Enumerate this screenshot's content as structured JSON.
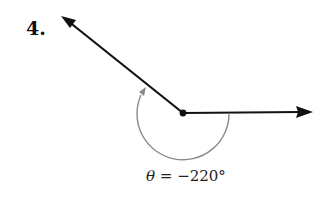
{
  "problem": {
    "number": "4.",
    "angle_symbol": "θ",
    "angle_equals": " = ",
    "angle_value": "−220°"
  },
  "figure": {
    "vertex": [
      183,
      113
    ],
    "initial_side_tip": [
      312,
      112
    ],
    "terminal_side_tip": [
      61,
      16
    ],
    "arc_radius": 46,
    "arc_direction": "clockwise",
    "colors": {
      "ray": "#111111",
      "arc": "#8a8a8a"
    }
  }
}
